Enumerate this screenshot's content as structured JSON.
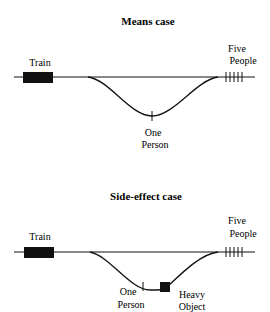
{
  "diagrams": [
    {
      "title": "Means case",
      "train_label": "Train",
      "five_label_line1": "Five",
      "five_label_line2": "People",
      "one_label_line1": "One",
      "one_label_line2": "Person",
      "people_on_main_track": 5,
      "people_on_side_track": 1
    },
    {
      "title": "Side-effect case",
      "train_label": "Train",
      "five_label_line1": "Five",
      "five_label_line2": "People",
      "one_label_line1": "One",
      "one_label_line2": "Person",
      "object_label_line1": "Heavy",
      "object_label_line2": "Object",
      "people_on_main_track": 5,
      "people_on_side_track": 1
    }
  ]
}
